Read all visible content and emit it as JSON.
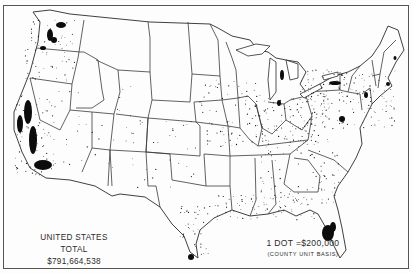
{
  "map": {
    "type": "dot-density",
    "region": "United States (48 states)",
    "border_color": "#3a3a3a",
    "dot_color": "#111111"
  },
  "legend": {
    "total_label": "UNITED STATES TOTAL",
    "total_value": "$791,664,538",
    "dot_scale": "1 DOT =$200,000",
    "basis": "(COUNTY UNIT BASIS)"
  },
  "concentrations": [
    {
      "name": "puget-sound",
      "shape": "blob",
      "cx": 50,
      "cy": 35,
      "rx": 3,
      "ry": 6
    },
    {
      "name": "yakima-valley",
      "shape": "blob",
      "cx": 61,
      "cy": 25,
      "rx": 5,
      "ry": 3
    },
    {
      "name": "wenatchee",
      "shape": "blob",
      "cx": 54,
      "cy": 40,
      "rx": 3,
      "ry": 3
    },
    {
      "name": "columbia-river",
      "shape": "blob",
      "cx": 43,
      "cy": 48,
      "rx": 3,
      "ry": 2
    },
    {
      "name": "sacramento-valley",
      "shape": "blob",
      "cx": 28,
      "cy": 112,
      "rx": 4,
      "ry": 12
    },
    {
      "name": "san-joaquin-valley",
      "shape": "blob",
      "cx": 33,
      "cy": 140,
      "rx": 4,
      "ry": 14
    },
    {
      "name": "coastal-california",
      "shape": "blob",
      "cx": 20,
      "cy": 124,
      "rx": 3,
      "ry": 9
    },
    {
      "name": "southern-california",
      "shape": "blob",
      "cx": 43,
      "cy": 165,
      "rx": 9,
      "ry": 5
    },
    {
      "name": "rio-grande-valley",
      "shape": "blob",
      "cx": 191,
      "cy": 257,
      "rx": 3,
      "ry": 3
    },
    {
      "name": "central-florida",
      "shape": "blob",
      "cx": 328,
      "cy": 233,
      "rx": 6,
      "ry": 8
    },
    {
      "name": "florida-ridge",
      "shape": "blob",
      "cx": 333,
      "cy": 227,
      "rx": 3,
      "ry": 5
    },
    {
      "name": "michigan-fruit-belt",
      "shape": "blob",
      "cx": 282,
      "cy": 75,
      "rx": 2,
      "ry": 5
    },
    {
      "name": "michigan-southwest",
      "shape": "blob",
      "cx": 279,
      "cy": 103,
      "rx": 2,
      "ry": 3
    },
    {
      "name": "western-new-york",
      "shape": "blob",
      "cx": 335,
      "cy": 83,
      "rx": 6,
      "ry": 2
    },
    {
      "name": "mid-atlantic",
      "shape": "blob",
      "cx": 342,
      "cy": 119,
      "rx": 3,
      "ry": 3
    },
    {
      "name": "new-jersey",
      "shape": "blob",
      "cx": 366,
      "cy": 95,
      "rx": 2,
      "ry": 3
    },
    {
      "name": "massachusetts",
      "shape": "blob",
      "cx": 388,
      "cy": 84,
      "rx": 2,
      "ry": 2
    },
    {
      "name": "maine",
      "shape": "blob",
      "cx": 395,
      "cy": 58,
      "rx": 1.5,
      "ry": 2
    }
  ],
  "scatter_regions": [
    {
      "name": "northeast",
      "x": 300,
      "y": 70,
      "w": 95,
      "h": 60,
      "n": 160
    },
    {
      "name": "ohio-valley",
      "x": 255,
      "y": 95,
      "w": 75,
      "h": 50,
      "n": 110
    },
    {
      "name": "southeast",
      "x": 260,
      "y": 140,
      "w": 80,
      "h": 65,
      "n": 90
    },
    {
      "name": "gulf-coast",
      "x": 215,
      "y": 195,
      "w": 100,
      "h": 25,
      "n": 70
    },
    {
      "name": "texas-coast",
      "x": 180,
      "y": 205,
      "w": 30,
      "h": 50,
      "n": 40
    },
    {
      "name": "midwest",
      "x": 200,
      "y": 80,
      "w": 60,
      "h": 70,
      "n": 70
    },
    {
      "name": "plains",
      "x": 130,
      "y": 120,
      "w": 80,
      "h": 70,
      "n": 30
    },
    {
      "name": "pacific-northwest",
      "x": 25,
      "y": 20,
      "w": 50,
      "h": 60,
      "n": 60
    },
    {
      "name": "california",
      "x": 15,
      "y": 95,
      "w": 40,
      "h": 80,
      "n": 80
    },
    {
      "name": "mountain-west",
      "x": 55,
      "y": 60,
      "w": 80,
      "h": 110,
      "n": 35
    }
  ]
}
